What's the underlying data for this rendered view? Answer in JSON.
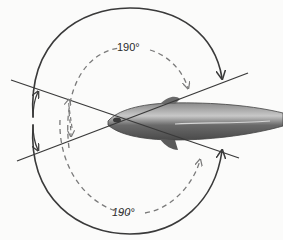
{
  "diagram": {
    "labels": {
      "outer_angle_top": "190°",
      "outer_angle_bottom": "190°"
    },
    "colors": {
      "line": "#3a3a3a",
      "dashed": "#7a7a7a",
      "background": "#fbfbfa",
      "body_dark": "#5a5a5a",
      "body_light": "#bdbdbd"
    }
  }
}
